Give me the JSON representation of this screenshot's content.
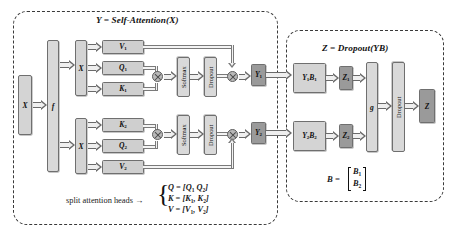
{
  "figure": {
    "type": "diagram",
    "background_color": "#ffffff"
  },
  "colors": {
    "box_fill_light": "#d4d4d4",
    "box_fill_pale": "#d9d9d9",
    "box_fill_dark": "#9a9a9a",
    "box_stroke": "#6f6f6f",
    "arrow_stroke": "#6a6a6a",
    "group_dash": "#3a3a3a",
    "text": "#111111"
  },
  "groups": [
    {
      "id": "self_attention",
      "title": "Y = Self-Attention(X)"
    },
    {
      "id": "dropout_block",
      "title": "Z = Dropout(YB)"
    }
  ],
  "nodes": {
    "input_x": "X",
    "f": "f",
    "x_head1": "X",
    "x_head2": "X",
    "v1": "V1",
    "q1": "Q1",
    "k1": "K1",
    "k2": "K2",
    "q2": "Q2",
    "v2": "V2",
    "softmax_1": "Softmax",
    "softmax_2": "Softmax",
    "dropout_1": "Dropout",
    "dropout_2": "Dropout",
    "y1": "Y1",
    "y2": "Y2",
    "y1b1": "Y1B1",
    "y2b2": "Y2B2",
    "z1": "Z1",
    "z2": "Z2",
    "g": "g",
    "dropout_final": "Dropout",
    "z_out": "Z"
  },
  "annotations": {
    "split_heads_label": "split attention heads →",
    "split_heads_equations": [
      "Q = [Q1  Q2]",
      "K = [K1, K2]",
      "V = [V1, V2]"
    ],
    "b_definition_lhs": "B =",
    "b_definition_rows": [
      "B1",
      "B2"
    ]
  },
  "operators": {
    "matmul_symbol": "⊗",
    "count": 4
  }
}
